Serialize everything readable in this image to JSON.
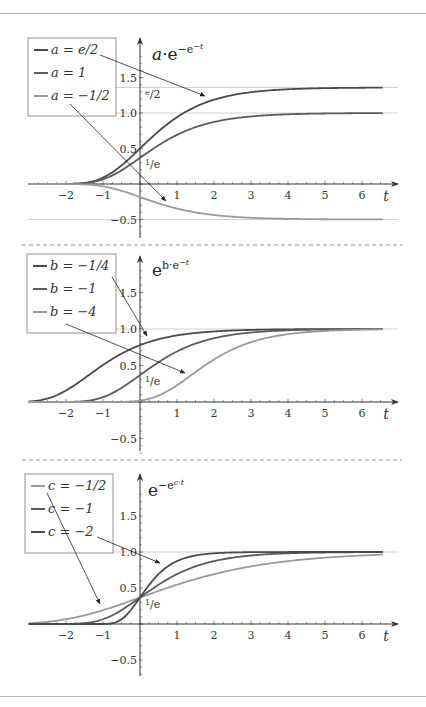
{
  "figure": {
    "top_rule_y": 13,
    "bottom_rule_y": 696,
    "separators_y": [
      245,
      460
    ],
    "colors": {
      "dark_curve": "#4a4a4a",
      "mid_curve": "#5c5c5c",
      "light_curve": "#9a9a9a",
      "axis": "#333333",
      "gridline": "#c8c8c8",
      "rule": "#b9b9b9"
    }
  },
  "chart_data": [
    {
      "type": "line",
      "title": "a·e^(−e^(−t))",
      "title_base": "a·e",
      "title_sup": "−e",
      "title_supsup": "−t",
      "xlabel": "t",
      "ylabel": "",
      "xlim": [
        -3,
        6.8
      ],
      "ylim": [
        -0.7,
        2.0
      ],
      "x_ticks": [
        -2,
        -1,
        1,
        2,
        3,
        4,
        5,
        6
      ],
      "y_ticks": [
        1.5,
        1.0,
        0.5,
        -0.5
      ],
      "y_tick_labels": [
        "1.5",
        "1.0",
        "0.5",
        "−0.5"
      ],
      "special_labels": [
        {
          "text": "e/2",
          "y": 1.359
        },
        {
          "text": "1/e",
          "y": 0.368
        }
      ],
      "gridlines_y": [
        1.359,
        1.0,
        -0.5
      ],
      "legend": [
        "a = e/2",
        "a = 1",
        "a = −1/2"
      ],
      "legend_position": "upper left",
      "formula": "a * exp(-exp(-t))",
      "series": [
        {
          "name": "a = e/2",
          "param": 1.359,
          "shade": "dark",
          "values_at": {
            "t": [
              -2,
              -1,
              0,
              1,
              2,
              3,
              4,
              5,
              6
            ],
            "y": [
              0.001,
              0.09,
              0.5,
              0.941,
              1.185,
              1.293,
              1.334,
              1.35,
              1.356
            ]
          }
        },
        {
          "name": "a = 1",
          "param": 1.0,
          "shade": "mid",
          "values_at": {
            "t": [
              -2,
              -1,
              0,
              1,
              2,
              3,
              4,
              5,
              6
            ],
            "y": [
              0.001,
              0.066,
              0.368,
              0.692,
              0.873,
              0.951,
              0.982,
              0.993,
              0.998
            ]
          }
        },
        {
          "name": "a = −1/2",
          "param": -0.5,
          "shade": "light",
          "values_at": {
            "t": [
              -2,
              -1,
              0,
              1,
              2,
              3,
              4,
              5,
              6
            ],
            "y": [
              -0.0003,
              -0.033,
              -0.184,
              -0.346,
              -0.436,
              -0.476,
              -0.491,
              -0.497,
              -0.499
            ]
          }
        }
      ]
    },
    {
      "type": "line",
      "title": "e^(b·e^(−t))",
      "title_base": "e",
      "title_sup": "b·e",
      "title_supsup": "−t",
      "xlabel": "t",
      "ylabel": "",
      "xlim": [
        -3,
        6.8
      ],
      "ylim": [
        -0.7,
        2.0
      ],
      "x_ticks": [
        -2,
        -1,
        1,
        2,
        3,
        4,
        5,
        6
      ],
      "y_ticks": [
        1.5,
        1.0,
        0.5,
        -0.5
      ],
      "y_tick_labels": [
        "1.5",
        "1.0",
        "0.5",
        "−0.5"
      ],
      "special_labels": [
        {
          "text": "1/e",
          "y": 0.368
        }
      ],
      "gridlines_y": [
        1.0
      ],
      "legend": [
        "b = −1/4",
        "b = −1",
        "b = −4"
      ],
      "legend_position": "upper left",
      "formula": "exp(b * exp(-t))",
      "series": [
        {
          "name": "b = −1/4",
          "param": -0.25,
          "shade": "dark",
          "values_at": {
            "t": [
              -2,
              -1,
              0,
              1,
              2,
              3,
              4,
              5,
              6
            ],
            "y": [
              0.158,
              0.507,
              0.779,
              0.912,
              0.967,
              0.988,
              0.995,
              0.998,
              0.999
            ]
          }
        },
        {
          "name": "b = −1",
          "param": -1,
          "shade": "mid",
          "values_at": {
            "t": [
              -2,
              -1,
              0,
              1,
              2,
              3,
              4,
              5,
              6
            ],
            "y": [
              0.001,
              0.066,
              0.368,
              0.692,
              0.873,
              0.951,
              0.982,
              0.993,
              0.998
            ]
          }
        },
        {
          "name": "b = −4",
          "param": -4,
          "shade": "light",
          "values_at": {
            "t": [
              -2,
              -1,
              0,
              1,
              2,
              3,
              4,
              5,
              6
            ],
            "y": [
              0.0,
              2e-05,
              0.018,
              0.23,
              0.582,
              0.819,
              0.929,
              0.973,
              0.99
            ]
          }
        }
      ]
    },
    {
      "type": "line",
      "title": "e^(−e^(c·t))",
      "title_base": "e",
      "title_sup": "−e",
      "title_supsup": "c·t",
      "xlabel": "t",
      "ylabel": "",
      "xlim": [
        -3,
        6.8
      ],
      "ylim": [
        -0.7,
        2.0
      ],
      "x_ticks": [
        -2,
        -1,
        1,
        2,
        3,
        4,
        5,
        6
      ],
      "y_ticks": [
        1.5,
        1.0,
        0.5,
        -0.5
      ],
      "y_tick_labels": [
        "1.5",
        "1.0",
        "0.5",
        "−0.5"
      ],
      "special_labels": [
        {
          "text": "1/e",
          "y": 0.368
        }
      ],
      "gridlines_y": [
        1.0
      ],
      "legend": [
        "c = −1/2",
        "c = −1",
        "c = −2"
      ],
      "legend_position": "upper left",
      "formula": "exp(-exp(c * t))",
      "series": [
        {
          "name": "c = −1/2",
          "param": -0.5,
          "shade": "light",
          "values_at": {
            "t": [
              -2,
              -1,
              0,
              1,
              2,
              3,
              4,
              5,
              6
            ],
            "y": [
              0.066,
              0.192,
              0.368,
              0.545,
              0.692,
              0.8,
              0.873,
              0.921,
              0.951
            ]
          }
        },
        {
          "name": "c = −1",
          "param": -1,
          "shade": "mid",
          "values_at": {
            "t": [
              -2,
              -1,
              0,
              1,
              2,
              3,
              4,
              5,
              6
            ],
            "y": [
              0.001,
              0.066,
              0.368,
              0.692,
              0.873,
              0.951,
              0.982,
              0.993,
              0.998
            ]
          }
        },
        {
          "name": "c = −2",
          "param": -2,
          "shade": "dark",
          "values_at": {
            "t": [
              -2,
              -1,
              0,
              1,
              2,
              3,
              4,
              5,
              6
            ],
            "y": [
              0.0,
              0.001,
              0.368,
              0.873,
              0.982,
              0.998,
              1.0,
              1.0,
              1.0
            ]
          }
        }
      ]
    }
  ],
  "panels": [
    {
      "origin_x": 140,
      "axis_y": 184,
      "unit_x": 37,
      "unit_y": 71,
      "axis_top": 38,
      "axis_bottom": 238,
      "legend_box": {
        "x": 28,
        "y": 38,
        "w": 88,
        "h": 78
      },
      "title_pos": {
        "x": 152,
        "y": 60
      },
      "arrows": [
        {
          "from": [
            100,
            55
          ],
          "to": [
            205,
            96
          ]
        },
        {
          "from": [
            70,
            104
          ],
          "to": [
            166,
            201
          ]
        }
      ]
    },
    {
      "origin_x": 140,
      "axis_y": 402,
      "unit_x": 37,
      "unit_y": 73,
      "axis_top": 256,
      "axis_bottom": 451,
      "legend_box": {
        "x": 27,
        "y": 254,
        "w": 89,
        "h": 79
      },
      "title_pos": {
        "x": 152,
        "y": 276
      },
      "arrows": [
        {
          "from": [
            112,
            277
          ],
          "to": [
            147,
            336
          ]
        },
        {
          "from": [
            66,
            324
          ],
          "to": [
            185,
            373
          ]
        }
      ]
    },
    {
      "origin_x": 140,
      "axis_y": 624,
      "unit_x": 37,
      "unit_y": 72,
      "axis_top": 474,
      "axis_bottom": 676,
      "legend_box": {
        "x": 25,
        "y": 474,
        "w": 88,
        "h": 79
      },
      "title_pos": {
        "x": 148,
        "y": 496
      },
      "arrows": [
        {
          "from": [
            47,
            493
          ],
          "to": [
            100,
            604
          ]
        },
        {
          "from": [
            97,
            537
          ],
          "to": [
            160,
            563
          ]
        }
      ]
    }
  ]
}
